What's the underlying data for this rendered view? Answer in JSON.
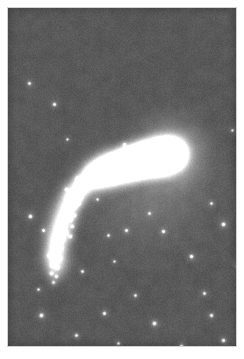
{
  "figure": {
    "kind": "astronomical-photograph",
    "caption": "",
    "alt_text": "Grayscale astronomical image of an irregular comet-shaped galaxy with a bright saturated nucleus at upper right and a curved chain of luminous knots sweeping toward the lower left, on a grainy mid-gray sky with scattered point stars.",
    "margin_color": "#ffffff",
    "plate": {
      "x": 8,
      "y": 8,
      "width": 228,
      "height": 338,
      "sky_background_color": "#595959",
      "noise_amplitude": 13,
      "vignette": true
    },
    "objects": {
      "nucleus": {
        "name": "galaxy-nucleus",
        "x": 164,
        "y": 145,
        "core_radius": 7,
        "halo_radius": 46,
        "peak_color": "#ffffff",
        "glow_color": "#d8d8d8"
      },
      "ridge": {
        "name": "luminous-ridge",
        "description": "narrow bright bar running from the nucleus toward the upper-left knot chain",
        "points": [
          [
            163,
            146
          ],
          [
            152,
            148
          ],
          [
            142,
            150
          ],
          [
            132,
            152
          ],
          [
            122,
            155
          ],
          [
            112,
            158
          ],
          [
            102,
            161
          ],
          [
            94,
            164
          ],
          [
            86,
            168
          ]
        ],
        "half_width": 3.4,
        "color": "#f4f4f4"
      },
      "arc": {
        "name": "knot-arc",
        "description": "curved tail of star-forming knots bending from the ridge downward to the lower left",
        "spine": [
          [
            96,
            161
          ],
          [
            86,
            167
          ],
          [
            77,
            174
          ],
          [
            69,
            182
          ],
          [
            62,
            191
          ],
          [
            57,
            201
          ],
          [
            53,
            212
          ],
          [
            50,
            223
          ],
          [
            48,
            234
          ],
          [
            47,
            244
          ],
          [
            47,
            253
          ],
          [
            48,
            262
          ]
        ],
        "half_width": 13,
        "color": "#cfcfcf"
      },
      "diffuse_halo": {
        "name": "diffuse-halo",
        "cx": 140,
        "cy": 185,
        "rx": 72,
        "ry": 62,
        "color": "#7d7d7d"
      }
    },
    "knots": [
      {
        "x": 157,
        "y": 145,
        "r": 2.3,
        "b": 252
      },
      {
        "x": 150,
        "y": 147,
        "r": 2.0,
        "b": 244
      },
      {
        "x": 143,
        "y": 148,
        "r": 2.2,
        "b": 248
      },
      {
        "x": 136,
        "y": 150,
        "r": 1.9,
        "b": 238
      },
      {
        "x": 129,
        "y": 152,
        "r": 2.1,
        "b": 244
      },
      {
        "x": 122,
        "y": 154,
        "r": 1.8,
        "b": 232
      },
      {
        "x": 116,
        "y": 156,
        "r": 2.2,
        "b": 243
      },
      {
        "x": 110,
        "y": 158,
        "r": 1.9,
        "b": 236
      },
      {
        "x": 104,
        "y": 160,
        "r": 2.3,
        "b": 246
      },
      {
        "x": 99,
        "y": 162,
        "r": 1.8,
        "b": 230
      },
      {
        "x": 94,
        "y": 164,
        "r": 2.4,
        "b": 248
      },
      {
        "x": 89,
        "y": 166,
        "r": 2.0,
        "b": 238
      },
      {
        "x": 85,
        "y": 169,
        "r": 2.5,
        "b": 250
      },
      {
        "x": 81,
        "y": 172,
        "r": 1.9,
        "b": 232
      },
      {
        "x": 78,
        "y": 170,
        "r": 2.1,
        "b": 240
      },
      {
        "x": 74,
        "y": 176,
        "r": 2.4,
        "b": 246
      },
      {
        "x": 71,
        "y": 181,
        "r": 2.0,
        "b": 234
      },
      {
        "x": 68,
        "y": 177,
        "r": 1.8,
        "b": 226
      },
      {
        "x": 66,
        "y": 186,
        "r": 2.5,
        "b": 248
      },
      {
        "x": 63,
        "y": 192,
        "r": 2.1,
        "b": 238
      },
      {
        "x": 60,
        "y": 188,
        "r": 1.7,
        "b": 222
      },
      {
        "x": 72,
        "y": 189,
        "r": 1.9,
        "b": 230
      },
      {
        "x": 59,
        "y": 198,
        "r": 2.3,
        "b": 242
      },
      {
        "x": 56,
        "y": 205,
        "r": 2.0,
        "b": 234
      },
      {
        "x": 66,
        "y": 199,
        "r": 1.8,
        "b": 226
      },
      {
        "x": 70,
        "y": 195,
        "r": 1.6,
        "b": 218
      },
      {
        "x": 54,
        "y": 212,
        "r": 2.4,
        "b": 244
      },
      {
        "x": 51,
        "y": 219,
        "r": 2.0,
        "b": 232
      },
      {
        "x": 62,
        "y": 211,
        "r": 1.8,
        "b": 226
      },
      {
        "x": 66,
        "y": 207,
        "r": 1.6,
        "b": 216
      },
      {
        "x": 49,
        "y": 226,
        "r": 2.3,
        "b": 240
      },
      {
        "x": 57,
        "y": 224,
        "r": 1.9,
        "b": 228
      },
      {
        "x": 47,
        "y": 233,
        "r": 2.1,
        "b": 236
      },
      {
        "x": 54,
        "y": 231,
        "r": 1.7,
        "b": 220
      },
      {
        "x": 62,
        "y": 228,
        "r": 1.6,
        "b": 214
      },
      {
        "x": 46,
        "y": 241,
        "r": 2.2,
        "b": 238
      },
      {
        "x": 52,
        "y": 240,
        "r": 1.8,
        "b": 224
      },
      {
        "x": 45,
        "y": 249,
        "r": 2.0,
        "b": 230
      },
      {
        "x": 51,
        "y": 250,
        "r": 1.7,
        "b": 218
      },
      {
        "x": 44,
        "y": 257,
        "r": 1.9,
        "b": 226
      },
      {
        "x": 49,
        "y": 259,
        "r": 1.6,
        "b": 212
      },
      {
        "x": 43,
        "y": 265,
        "r": 1.7,
        "b": 216
      },
      {
        "x": 48,
        "y": 268,
        "r": 1.5,
        "b": 206
      },
      {
        "x": 45,
        "y": 274,
        "r": 1.5,
        "b": 202
      },
      {
        "x": 80,
        "y": 163,
        "r": 1.7,
        "b": 224
      },
      {
        "x": 76,
        "y": 182,
        "r": 1.6,
        "b": 214
      },
      {
        "x": 69,
        "y": 170,
        "r": 1.6,
        "b": 216
      },
      {
        "x": 58,
        "y": 181,
        "r": 1.5,
        "b": 206
      },
      {
        "x": 64,
        "y": 218,
        "r": 1.5,
        "b": 204
      },
      {
        "x": 41,
        "y": 247,
        "r": 1.5,
        "b": 204
      }
    ],
    "stars": [
      {
        "x": 21,
        "y": 75,
        "r": 1.4,
        "b": 226
      },
      {
        "x": 46,
        "y": 96,
        "r": 1.5,
        "b": 234
      },
      {
        "x": 167,
        "y": 140,
        "r": 1.6,
        "b": 244
      },
      {
        "x": 116,
        "y": 136,
        "r": 1.3,
        "b": 218
      },
      {
        "x": 22,
        "y": 208,
        "r": 1.7,
        "b": 242
      },
      {
        "x": 35,
        "y": 222,
        "r": 1.4,
        "b": 224
      },
      {
        "x": 215,
        "y": 216,
        "r": 1.7,
        "b": 244
      },
      {
        "x": 183,
        "y": 248,
        "r": 1.6,
        "b": 240
      },
      {
        "x": 155,
        "y": 223,
        "r": 1.5,
        "b": 232
      },
      {
        "x": 118,
        "y": 222,
        "r": 1.4,
        "b": 226
      },
      {
        "x": 100,
        "y": 227,
        "r": 1.3,
        "b": 214
      },
      {
        "x": 74,
        "y": 263,
        "r": 1.4,
        "b": 224
      },
      {
        "x": 33,
        "y": 307,
        "r": 1.7,
        "b": 244
      },
      {
        "x": 96,
        "y": 305,
        "r": 1.5,
        "b": 234
      },
      {
        "x": 146,
        "y": 315,
        "r": 1.7,
        "b": 246
      },
      {
        "x": 203,
        "y": 307,
        "r": 1.5,
        "b": 232
      },
      {
        "x": 215,
        "y": 332,
        "r": 1.6,
        "b": 238
      },
      {
        "x": 173,
        "y": 338,
        "r": 1.7,
        "b": 246
      },
      {
        "x": 127,
        "y": 287,
        "r": 1.3,
        "b": 216
      },
      {
        "x": 196,
        "y": 285,
        "r": 1.4,
        "b": 224
      },
      {
        "x": 68,
        "y": 327,
        "r": 1.4,
        "b": 226
      },
      {
        "x": 110,
        "y": 335,
        "r": 1.3,
        "b": 214
      },
      {
        "x": 229,
        "y": 258,
        "r": 1.4,
        "b": 226
      },
      {
        "x": 203,
        "y": 195,
        "r": 1.3,
        "b": 214
      },
      {
        "x": 141,
        "y": 205,
        "r": 1.3,
        "b": 212
      },
      {
        "x": 30,
        "y": 281,
        "r": 1.3,
        "b": 212
      },
      {
        "x": 89,
        "y": 191,
        "r": 1.2,
        "b": 206
      },
      {
        "x": 106,
        "y": 253,
        "r": 1.2,
        "b": 204
      },
      {
        "x": 224,
        "y": 122,
        "r": 1.2,
        "b": 204
      },
      {
        "x": 59,
        "y": 131,
        "r": 1.2,
        "b": 202
      }
    ]
  }
}
